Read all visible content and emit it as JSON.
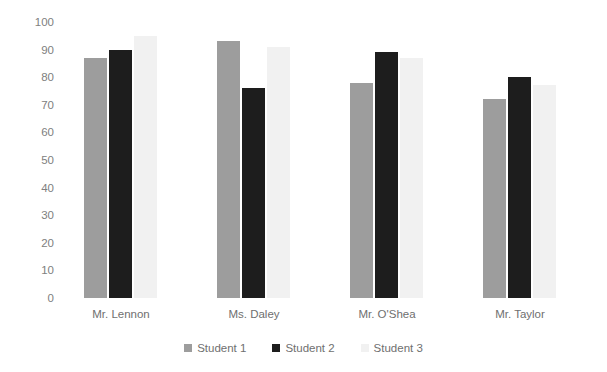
{
  "chart_data": {
    "type": "bar",
    "title": "",
    "subtitle": "",
    "xlabel": "",
    "ylabel": "",
    "ylim": [
      0,
      100
    ],
    "ytick_step": 10,
    "yticks": [
      100,
      90,
      80,
      70,
      60,
      50,
      40,
      30,
      20,
      10,
      0
    ],
    "categories": [
      "Mr. Lennon",
      "Ms. Daley",
      "Mr. O'Shea",
      "Mr. Taylor"
    ],
    "grid": false,
    "legend_position": "bottom",
    "series": [
      {
        "name": "Student 1",
        "color": "#9d9d9d",
        "values": [
          87,
          93,
          78,
          72
        ]
      },
      {
        "name": "Student 2",
        "color": "#1d1d1d",
        "values": [
          90,
          76,
          89,
          80
        ]
      },
      {
        "name": "Student 3",
        "color": "#f1f1f1",
        "values": [
          95,
          91,
          87,
          77
        ]
      }
    ]
  },
  "axis": {
    "y_tick_labels": [
      "100",
      "90",
      "80",
      "70",
      "60",
      "50",
      "40",
      "30",
      "20",
      "10",
      "0"
    ]
  },
  "legend": {
    "items": [
      {
        "label": "Student 1"
      },
      {
        "label": "Student 2"
      },
      {
        "label": "Student 3"
      }
    ]
  },
  "colors": {
    "background": "#ffffff",
    "axis_text": "#808080",
    "label_text": "#6f6f6f",
    "series_1": "#9d9d9d",
    "series_2": "#1d1d1d",
    "series_3": "#f1f1f1"
  }
}
